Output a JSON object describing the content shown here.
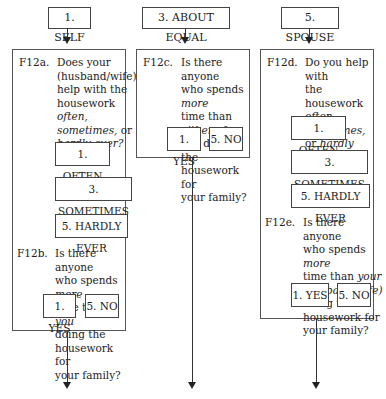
{
  "columns": [
    {
      "header": "1. SELF",
      "questions": [
        {
          "code": "F12a.",
          "text_lines": [
            "Does your",
            "(husband/wife)",
            "help with the",
            "housework often,",
            "sometimes, or",
            "hardly ever?"
          ],
          "options": [
            "1. OFTEN",
            "3. SOMETIMES",
            "5. HARDLY EVER"
          ]
        },
        {
          "code": "F12b.",
          "text_lines": [
            "Is there anyone",
            "who spends more",
            "time than you",
            "doing the",
            "housework for",
            "your family?"
          ],
          "options": [
            "1. YES",
            "5. NO"
          ]
        }
      ]
    },
    {
      "header": "3. ABOUT EQUAL",
      "questions": [
        {
          "code": "F12c.",
          "text_lines": [
            "Is there anyone",
            "who spends more",
            "time than either of",
            "you doing the",
            "housework for",
            "your family?"
          ],
          "options": [
            "1. YES",
            "5. NO"
          ]
        }
      ]
    },
    {
      "header": "5. SPOUSE",
      "questions": [
        {
          "code": "F12d.",
          "text_lines": [
            "Do you help with",
            "the housework",
            "often, sometimes,",
            "or hardly ever?"
          ],
          "options": [
            "1. OFTEN",
            "3. SOMETIMES",
            "5. HARDLY EVER"
          ]
        },
        {
          "code": "F12e.",
          "text_lines": [
            "Is there anyone",
            "who spends more",
            "time than your",
            "(husband/wife)",
            "doing the",
            "housework for",
            "your family?"
          ],
          "options": [
            "1. YES",
            "5. NO"
          ]
        }
      ]
    }
  ],
  "colors": {
    "line": "#333333",
    "text": "#222222",
    "background": "#ffffff"
  }
}
